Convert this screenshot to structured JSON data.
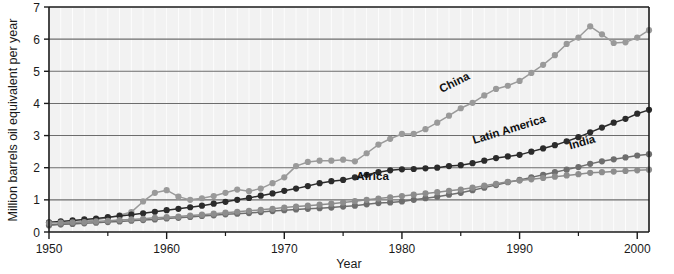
{
  "chart_data": {
    "type": "line",
    "title": "",
    "xlabel": "Year",
    "ylabel": "Million barrels oil equivalent per year",
    "xlim": [
      1950,
      2001
    ],
    "ylim": [
      0,
      7
    ],
    "xticks": [
      1950,
      1960,
      1970,
      1980,
      1990,
      2000
    ],
    "xticks_minor": [
      1955,
      1965,
      1975,
      1985,
      1995
    ],
    "yticks": [
      0,
      1,
      2,
      3,
      4,
      5,
      6,
      7
    ],
    "grid": "horizontal",
    "legend_position": "inline-annotations",
    "markers": "filled-circles",
    "x": [
      1950,
      1951,
      1952,
      1953,
      1954,
      1955,
      1956,
      1957,
      1958,
      1959,
      1960,
      1961,
      1962,
      1963,
      1964,
      1965,
      1966,
      1967,
      1968,
      1969,
      1970,
      1971,
      1972,
      1973,
      1974,
      1975,
      1976,
      1977,
      1978,
      1979,
      1980,
      1981,
      1982,
      1983,
      1984,
      1985,
      1986,
      1987,
      1988,
      1989,
      1990,
      1991,
      1992,
      1993,
      1994,
      1995,
      1996,
      1997,
      1998,
      1999,
      2000,
      2001
    ],
    "series": [
      {
        "name": "China",
        "color": "#9a9a9a",
        "label_x": 1984.6,
        "label_y": 4.55,
        "label_rotation": -27,
        "values": [
          0.2,
          0.24,
          0.28,
          0.33,
          0.38,
          0.44,
          0.52,
          0.62,
          0.95,
          1.22,
          1.3,
          1.1,
          1.0,
          1.05,
          1.12,
          1.22,
          1.32,
          1.27,
          1.35,
          1.52,
          1.7,
          2.05,
          2.18,
          2.22,
          2.22,
          2.25,
          2.2,
          2.45,
          2.72,
          2.9,
          3.05,
          3.05,
          3.2,
          3.4,
          3.62,
          3.85,
          4.02,
          4.25,
          4.45,
          4.55,
          4.7,
          4.95,
          5.2,
          5.5,
          5.85,
          6.05,
          6.4,
          6.15,
          5.88,
          5.9,
          6.05,
          6.28
        ]
      },
      {
        "name": "Latin America",
        "color": "#2b2b2b",
        "label_x": 1989.2,
        "label_y": 3.08,
        "label_rotation": -17,
        "values": [
          0.3,
          0.33,
          0.36,
          0.39,
          0.42,
          0.46,
          0.5,
          0.54,
          0.58,
          0.63,
          0.68,
          0.72,
          0.77,
          0.82,
          0.88,
          0.94,
          1.0,
          1.06,
          1.13,
          1.2,
          1.28,
          1.35,
          1.43,
          1.52,
          1.58,
          1.62,
          1.7,
          1.78,
          1.86,
          1.92,
          1.95,
          1.96,
          1.98,
          2.0,
          2.05,
          2.08,
          2.14,
          2.22,
          2.3,
          2.35,
          2.4,
          2.5,
          2.6,
          2.7,
          2.82,
          2.95,
          3.1,
          3.25,
          3.4,
          3.52,
          3.68,
          3.8
        ]
      },
      {
        "name": "India",
        "color": "#6e6e6e",
        "label_x": 1995.4,
        "label_y": 2.68,
        "label_rotation": -16,
        "values": [
          0.22,
          0.24,
          0.25,
          0.27,
          0.29,
          0.31,
          0.33,
          0.35,
          0.37,
          0.39,
          0.42,
          0.44,
          0.47,
          0.5,
          0.52,
          0.55,
          0.57,
          0.59,
          0.62,
          0.65,
          0.68,
          0.7,
          0.72,
          0.74,
          0.76,
          0.79,
          0.82,
          0.86,
          0.9,
          0.92,
          0.95,
          1.0,
          1.05,
          1.1,
          1.16,
          1.22,
          1.3,
          1.38,
          1.46,
          1.55,
          1.62,
          1.7,
          1.78,
          1.86,
          1.94,
          2.02,
          2.12,
          2.2,
          2.26,
          2.32,
          2.38,
          2.42
        ]
      },
      {
        "name": "Africa",
        "color": "#8d8d8d",
        "label_x": 1977.5,
        "label_y": 1.62,
        "label_rotation": 0,
        "values": [
          0.28,
          0.29,
          0.3,
          0.31,
          0.33,
          0.35,
          0.37,
          0.39,
          0.41,
          0.44,
          0.46,
          0.48,
          0.51,
          0.54,
          0.57,
          0.6,
          0.63,
          0.66,
          0.69,
          0.72,
          0.76,
          0.79,
          0.82,
          0.85,
          0.88,
          0.92,
          0.96,
          1.0,
          1.04,
          1.08,
          1.12,
          1.16,
          1.2,
          1.24,
          1.28,
          1.32,
          1.38,
          1.44,
          1.5,
          1.56,
          1.6,
          1.64,
          1.68,
          1.72,
          1.76,
          1.8,
          1.84,
          1.86,
          1.88,
          1.9,
          1.92,
          1.94
        ]
      }
    ]
  },
  "style": {
    "plot_bg": "#f2f2f2",
    "grid_color": "#6d6d6d",
    "axis_color": "#1a1a1a",
    "page_bg": "#ffffff"
  }
}
